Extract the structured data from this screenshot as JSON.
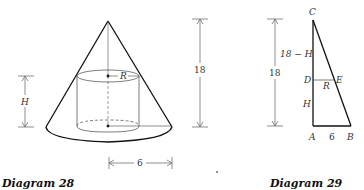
{
  "diagram28": {
    "caption": "Diagram 28",
    "labels": {
      "radius": "R",
      "height": "H",
      "cone_height": "18",
      "base_radius": "6"
    }
  },
  "diagram29": {
    "caption": "Diagram 29",
    "vertices": {
      "top": "C",
      "mid_left": "D",
      "mid_right": "E",
      "bottom_left": "A",
      "bottom_right": "B"
    },
    "labels": {
      "upper_segment": "18 − H",
      "total_height": "18",
      "radius": "R",
      "height": "H",
      "base": "6"
    }
  }
}
